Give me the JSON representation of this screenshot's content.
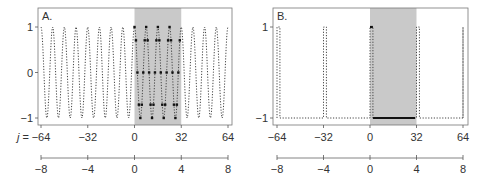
{
  "chart_data": [
    {
      "type": "line",
      "panel_label": "A.",
      "title": "",
      "xlabel": "j",
      "ylabel": "",
      "x_axis_prefix": "j =",
      "xlim": [
        -64,
        64
      ],
      "ylim": [
        -1,
        1
      ],
      "yticks": [
        1,
        0,
        -1
      ],
      "ytick_labels": [
        "1",
        "0",
        "−1"
      ],
      "xticks": [
        -64,
        -32,
        0,
        32,
        64
      ],
      "xtick_labels": [
        "−64",
        "−32",
        "0",
        "32",
        "64"
      ],
      "secondary_xticks": [
        -8,
        -4,
        0,
        4,
        8
      ],
      "secondary_xtick_labels": [
        "−8",
        "−4",
        "0",
        "4",
        "8"
      ],
      "shaded_region": [
        0,
        32
      ],
      "series": [
        {
          "name": "cosine (periodic extension)",
          "style": "dotted",
          "function": "cos(2*pi*j/8)",
          "period": 8
        },
        {
          "name": "sampled window",
          "style": "points",
          "x_range": [
            0,
            31
          ],
          "values_levels": [
            1,
            0.707,
            0,
            -0.707,
            -1
          ]
        }
      ],
      "grid": false
    },
    {
      "type": "line",
      "panel_label": "B.",
      "title": "",
      "xlabel": "j",
      "ylabel": "",
      "xlim": [
        -64,
        64
      ],
      "ylim": [
        -1,
        1
      ],
      "yticks": [
        1,
        -1
      ],
      "ytick_labels": [
        "1",
        "−1"
      ],
      "xticks": [
        -64,
        -32,
        0,
        32,
        64
      ],
      "xtick_labels": [
        "−64",
        "−32",
        "0",
        "32",
        "64"
      ],
      "secondary_xticks": [
        -8,
        -4,
        0,
        4,
        8
      ],
      "secondary_xtick_labels": [
        "−8",
        "−4",
        "0",
        "4",
        "8"
      ],
      "shaded_region": [
        0,
        32
      ],
      "series": [
        {
          "name": "pulse train (periodic extension)",
          "style": "dotted",
          "period": 32,
          "high_width": 2,
          "high_value": 1,
          "low_value": -1
        },
        {
          "name": "window",
          "style": "solid",
          "segments": [
            {
              "x": [
                0,
                2
              ],
              "y": 1
            },
            {
              "x": [
                2,
                31
              ],
              "y": -1
            }
          ]
        }
      ],
      "grid": false
    }
  ],
  "panels": {
    "a": {
      "label": "A.",
      "prefix": "j ="
    },
    "b": {
      "label": "B."
    }
  }
}
